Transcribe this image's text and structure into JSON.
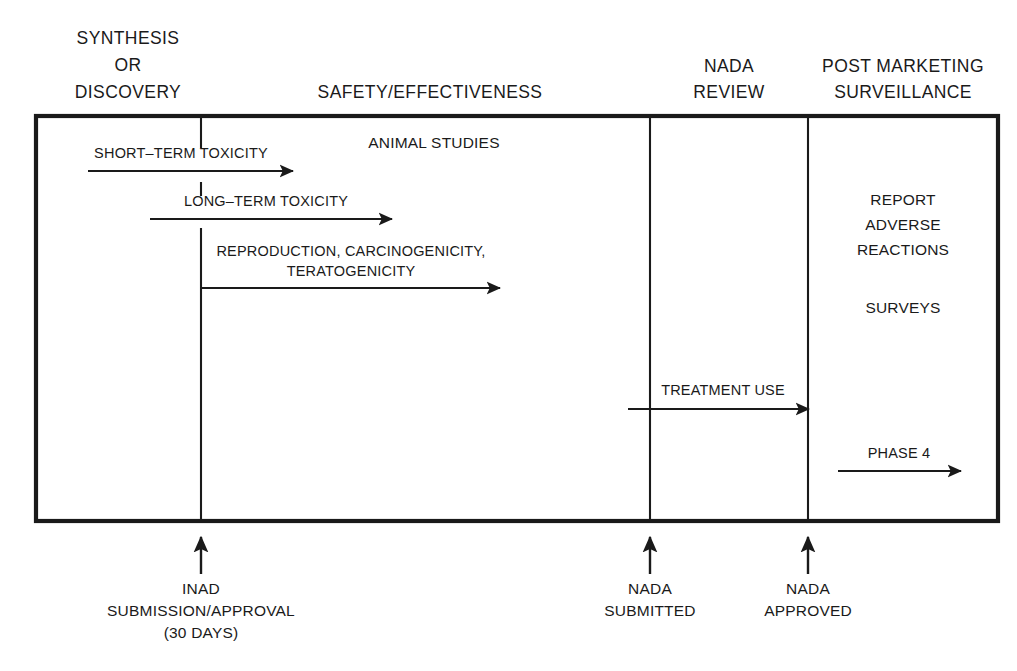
{
  "diagram": {
    "colors": {
      "ink": "#1a1a1a",
      "background": "#ffffff"
    },
    "phase_headers": [
      {
        "id": "synthesis",
        "lines": [
          "SYNTHESIS",
          "OR",
          "DISCOVERY"
        ],
        "cx": 128,
        "top_y": 44
      },
      {
        "id": "safety-effectiveness",
        "lines": [
          "SAFETY/EFFECTIVENESS"
        ],
        "cx": 430,
        "top_y": 98
      },
      {
        "id": "nada-review",
        "lines": [
          "NADA",
          "REVIEW"
        ],
        "cx": 729,
        "top_y": 72
      },
      {
        "id": "post-marketing-surveillance",
        "lines": [
          "POST MARKETING",
          "SURVEILLANCE"
        ],
        "cx": 903,
        "top_y": 72
      }
    ],
    "section_label": {
      "text": "ANIMAL STUDIES",
      "cx": 434,
      "cy": 148
    },
    "tracks": [
      {
        "id": "short-term-toxicity",
        "label": "SHORT–TERM TOXICITY",
        "label_cx": 181,
        "label_cy": 158,
        "x1": 88,
        "x2": 293,
        "y": 171
      },
      {
        "id": "long-term-toxicity",
        "label": "LONG–TERM TOXICITY",
        "label_cx": 266,
        "label_cy": 206,
        "x1": 150,
        "x2": 392,
        "y": 219
      },
      {
        "id": "reproduction-carcinogenicity-teratogenicity",
        "label": "REPRODUCTION, CARCINOGENICITY,",
        "label2": "TERATOGENICITY",
        "label_cx": 351,
        "label_cy": 256,
        "label2_cy": 276,
        "x1": 201,
        "x2": 500,
        "y": 288
      },
      {
        "id": "treatment-use",
        "label": "TREATMENT USE",
        "label_cx": 723,
        "label_cy": 395,
        "x1": 628,
        "x2": 808,
        "y": 409
      },
      {
        "id": "phase-4",
        "label": "PHASE 4",
        "label_cx": 899,
        "label_cy": 458,
        "x1": 838,
        "x2": 961,
        "y": 471
      }
    ],
    "surveillance_items": [
      {
        "id": "report-adverse-reactions",
        "lines": [
          "REPORT",
          "ADVERSE",
          "REACTIONS"
        ],
        "cx": 903,
        "top_y": 205
      },
      {
        "id": "surveys",
        "lines": [
          "SURVEYS"
        ],
        "cx": 903,
        "top_y": 313
      }
    ],
    "milestones": [
      {
        "id": "inad-submission-approval",
        "x": 201,
        "lines": [
          "INAD",
          "SUBMISSION/APPROVAL",
          "(30 DAYS)"
        ],
        "label_top_y": 588
      },
      {
        "id": "nada-submitted",
        "x": 650,
        "lines": [
          "NADA",
          "SUBMITTED"
        ],
        "label_top_y": 588
      },
      {
        "id": "nada-approved",
        "x": 808,
        "lines": [
          "NADA",
          "APPROVED"
        ],
        "label_top_y": 588
      }
    ],
    "frame": {
      "x": 36,
      "y": 116,
      "width": 962,
      "height": 405
    },
    "dividers": [
      {
        "id": "divider-synthesis-safety",
        "x": 201
      },
      {
        "id": "divider-safety-review",
        "x": 650
      },
      {
        "id": "divider-review-postmarket",
        "x": 808
      }
    ]
  }
}
